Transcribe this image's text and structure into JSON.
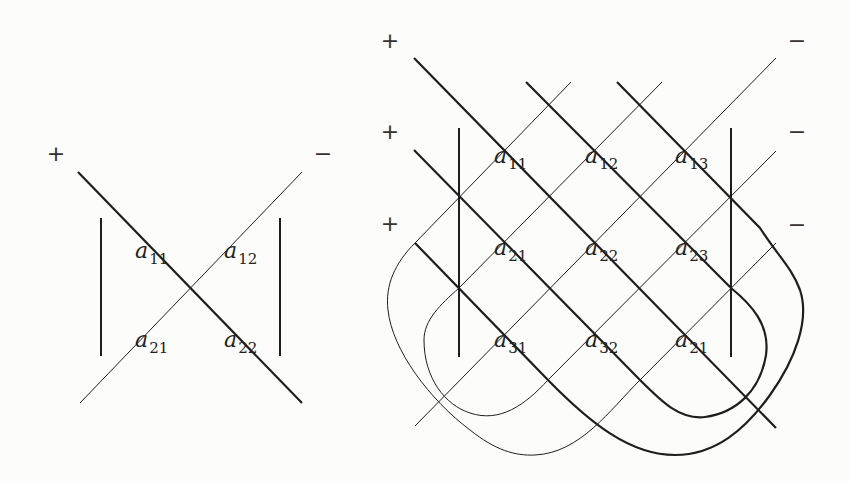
{
  "colors": {
    "background": "#fcfcfa",
    "stroke": "#1e1e1e",
    "text": "#222222"
  },
  "diagram_2x2": {
    "title": "2x2 determinant rule",
    "signs": [
      {
        "text": "+",
        "x": 56,
        "y": 154
      },
      {
        "text": "−",
        "x": 323,
        "y": 154
      }
    ],
    "entries": [
      {
        "base": "a",
        "sub": "11",
        "x": 135,
        "y": 240
      },
      {
        "base": "a",
        "sub": "12",
        "x": 224,
        "y": 240
      },
      {
        "base": "a",
        "sub": "21",
        "x": 135,
        "y": 329
      },
      {
        "base": "a",
        "sub": "22",
        "x": 224,
        "y": 329
      }
    ],
    "bars": [
      {
        "x1": 101,
        "y1": 218,
        "x2": 101,
        "y2": 356
      },
      {
        "x1": 280,
        "y1": 218,
        "x2": 280,
        "y2": 356
      }
    ],
    "thick_paths": [
      "M78 172 L302 403"
    ],
    "thin_paths": [
      "M80 403 L302 172"
    ]
  },
  "diagram_3x3": {
    "title": "3x3 determinant rule (Sarrus)",
    "signs": [
      {
        "text": "+",
        "x": 390,
        "y": 41
      },
      {
        "text": "+",
        "x": 390,
        "y": 132
      },
      {
        "text": "+",
        "x": 390,
        "y": 224
      },
      {
        "text": "−",
        "x": 797,
        "y": 41
      },
      {
        "text": "−",
        "x": 797,
        "y": 132
      },
      {
        "text": "−",
        "x": 797,
        "y": 225
      }
    ],
    "entries": [
      {
        "base": "a",
        "sub": "11",
        "x": 494,
        "y": 145
      },
      {
        "base": "a",
        "sub": "12",
        "x": 585,
        "y": 145
      },
      {
        "base": "a",
        "sub": "13",
        "x": 675,
        "y": 145
      },
      {
        "base": "a",
        "sub": "21",
        "x": 494,
        "y": 237
      },
      {
        "base": "a",
        "sub": "22",
        "x": 585,
        "y": 237
      },
      {
        "base": "a",
        "sub": "23",
        "x": 675,
        "y": 237
      },
      {
        "base": "a",
        "sub": "31",
        "x": 494,
        "y": 329
      },
      {
        "base": "a",
        "sub": "32",
        "x": 585,
        "y": 329
      },
      {
        "base": "a",
        "sub": "21",
        "x": 675,
        "y": 329
      }
    ],
    "bars": [
      {
        "x1": 459,
        "y1": 128,
        "x2": 459,
        "y2": 357
      },
      {
        "x1": 731,
        "y1": 128,
        "x2": 731,
        "y2": 357
      }
    ],
    "thick_paths": [
      "M414 58 L776 428",
      "M414 150 L640 380 C662 402 680 420 705 417 C735 413 760 392 766 355 C770 325 752 305 731 288 L526 82",
      "M415 243 L548 380 C590 423 630 455 675 455 C715 455 745 430 770 395 C795 360 810 320 800 290 C792 268 778 256 760 228 L617 82"
    ],
    "thin_paths": [
      "M776 58 L415 426",
      "M571 82 L415 243 C395 263 385 285 388 310 C392 350 430 400 470 430 C495 450 515 456 535 455 C580 453 610 410 640 380 L776 243",
      "M662 82 L459 288 C440 305 424 320 424 340 C424 378 445 405 470 413 C500 423 525 405 548 380 L776 151"
    ]
  }
}
